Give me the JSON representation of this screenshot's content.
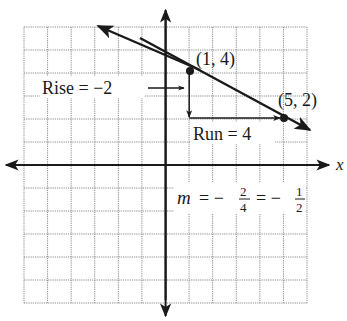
{
  "chart_data": {
    "type": "line",
    "title": "",
    "xlabel": "x",
    "ylabel": "",
    "xlim": [
      -6,
      6
    ],
    "ylim": [
      -6,
      6
    ],
    "grid": true,
    "series": [
      {
        "name": "line through (1,4) and (5,2)",
        "points": [
          [
            1,
            4
          ],
          [
            5,
            2
          ]
        ],
        "slope": -0.5,
        "extends": "both directions (arrows)"
      }
    ],
    "points": [
      {
        "label": "(1, 4)",
        "x": 1,
        "y": 4
      },
      {
        "label": "(5, 2)",
        "x": 5,
        "y": 2
      }
    ],
    "annotations": [
      {
        "text": "Rise = −2",
        "type": "vertical arrow from (1,4) down to (1,2)"
      },
      {
        "text": "Run = 4",
        "type": "horizontal arrow from (1,2) to (5,2)"
      },
      {
        "text": "m = −2/4 = −1/2",
        "type": "slope formula"
      }
    ]
  },
  "labels": {
    "x_axis": "x",
    "point1": "(1, 4)",
    "point2": "(5, 2)",
    "rise": "Rise = −2",
    "run": "Run = 4",
    "slope_m": "m",
    "slope_eq1": "= −",
    "slope_num1": "2",
    "slope_den1": "4",
    "slope_eq2": "= −",
    "slope_num2": "1",
    "slope_den2": "2"
  },
  "colors": {
    "ink": "#1a1a1a",
    "grid": "#8a8a8a",
    "background": "#ffffff"
  }
}
